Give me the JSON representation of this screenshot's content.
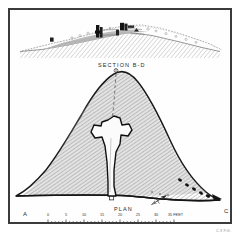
{
  "plate": {
    "kind": "archaeological-survey-plate",
    "section_label": "SECTION  B-D",
    "plan_label": "PLAN",
    "corner_labels": {
      "left": "A",
      "right": "C"
    },
    "credit": "C.3 P.G.",
    "colors": {
      "frame": "#3b3b3b",
      "paper": "#fefefe",
      "hatch": "#9a9a9a",
      "ink": "#2a2a2a",
      "chamber_fill": "#fbfbfb"
    }
  },
  "north_arrow": {
    "name": "north-arrow",
    "label": ""
  },
  "scale_bar": {
    "unit": "FEET",
    "ticks": [
      "0",
      "5",
      "10",
      "15",
      "20",
      "25",
      "30",
      "35"
    ],
    "minor_divisions": 5,
    "end_label": "35 FEET"
  },
  "section_drawing": {
    "title": "SECTION  B-D",
    "features": [
      "mound profile",
      "ground line hatching",
      "stone chamber blocks",
      "turf line"
    ]
  },
  "plan_drawing": {
    "title": "PLAN",
    "features": [
      "mound outline",
      "hatched mound body",
      "cruciform chamber",
      "entrance passage",
      "centre line",
      "kerb stones"
    ]
  }
}
